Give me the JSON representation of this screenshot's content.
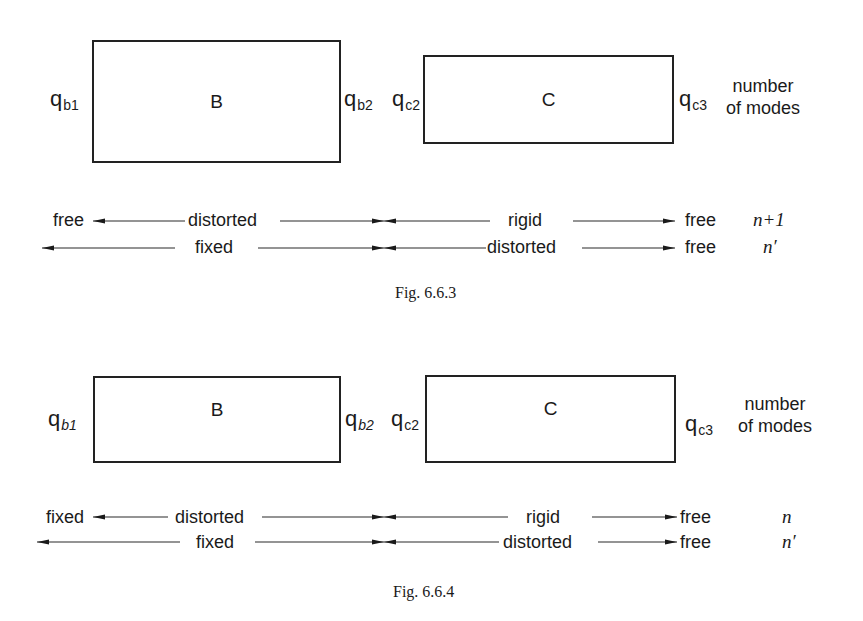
{
  "figures": [
    {
      "caption": "Fig. 6.6.3",
      "boxes": {
        "left": "B",
        "right": "C"
      },
      "coords": {
        "qb1": {
          "q": "q",
          "sub": "b1"
        },
        "qb2": {
          "q": "q",
          "sub": "b2"
        },
        "qc2": {
          "q": "q",
          "sub": "c2"
        },
        "qc3": {
          "q": "q",
          "sub": "c3"
        }
      },
      "header": {
        "line1": "number",
        "line2": "of modes"
      },
      "rows": [
        {
          "left_end": "free",
          "left_segment": "distorted",
          "right_segment": "rigid",
          "right_end": "free",
          "modes": "n+1"
        },
        {
          "left_end": "",
          "left_segment": "fixed",
          "right_segment": "distorted",
          "right_end": "free",
          "modes": "n′"
        }
      ]
    },
    {
      "caption": "Fig. 6.6.4",
      "boxes": {
        "left": "B",
        "right": "C"
      },
      "coords": {
        "qb1": {
          "q": "q",
          "sub": "b1"
        },
        "qb2": {
          "q": "q",
          "sub": "b2"
        },
        "qc2": {
          "q": "q",
          "sub": "c2"
        },
        "qc3": {
          "q": "q",
          "sub": "c3"
        }
      },
      "header": {
        "line1": "number",
        "line2": "of modes"
      },
      "rows": [
        {
          "left_end": "fixed",
          "left_segment": "distorted",
          "right_segment": "rigid",
          "right_end": "free",
          "modes": "n"
        },
        {
          "left_end": "",
          "left_segment": "fixed",
          "right_segment": "distorted",
          "right_end": "free",
          "modes": "n′"
        }
      ]
    }
  ]
}
